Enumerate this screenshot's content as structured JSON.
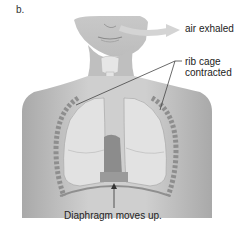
{
  "figure": {
    "panel_label": "b.",
    "labels": {
      "air": "air exhaled",
      "rib_line1": "rib cage",
      "rib_line2": "contracted",
      "diaphragm": "Diaphragm moves up."
    }
  },
  "colors": {
    "skin": "#b9b9b9",
    "skin_light": "#d6d6d6",
    "lung": "#e2e2e2",
    "heart": "#8a8a8a",
    "rib": "#9a9a9a",
    "arrow": "#cfcfcf",
    "leader": "#444444"
  }
}
